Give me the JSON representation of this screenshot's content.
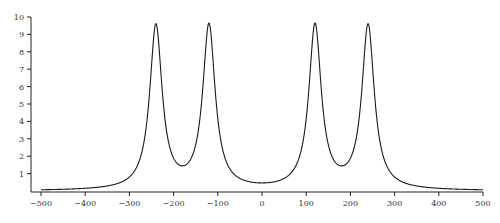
{
  "chart_data": {
    "type": "line",
    "title": "",
    "xlabel": "",
    "ylabel": "",
    "xlim": [
      -500,
      500
    ],
    "ylim": [
      0,
      10
    ],
    "grid": false,
    "legend": null,
    "x_ticks": [
      -500,
      -400,
      -300,
      -200,
      -100,
      0,
      100,
      200,
      300,
      400,
      500
    ],
    "x_tick_labels": [
      "−500",
      "−400",
      "−300",
      "−200",
      "−100",
      "0",
      "100",
      "200",
      "300",
      "400",
      "500"
    ],
    "y_ticks": [
      1,
      2,
      3,
      4,
      5,
      6,
      7,
      8,
      9,
      10
    ],
    "y_tick_labels": [
      "1",
      "2",
      "3",
      "4",
      "5",
      "6",
      "7",
      "8",
      "9",
      "10"
    ],
    "series": [
      {
        "name": "curve",
        "color": "#1a1a1a",
        "model": {
          "kind": "sum_of_lorentzians",
          "centers": [
            -240,
            -120,
            120,
            240
          ],
          "amplitude": 9.4,
          "half_width": 17
        },
        "x": [
          -500,
          -400,
          -300,
          -240,
          -180,
          -120,
          0,
          120,
          180,
          240,
          300,
          400,
          500
        ],
        "values": [
          0.15,
          0.3,
          0.75,
          9.8,
          1.5,
          9.8,
          0.5,
          9.8,
          1.5,
          9.8,
          0.75,
          0.3,
          0.15
        ]
      }
    ]
  },
  "layout": {
    "x_origin_px": 41,
    "x_end_px": 483,
    "y_zero_px": 191,
    "y_ten_px": 17,
    "axis_left_px": 31,
    "axis_bottom_px": 192
  }
}
